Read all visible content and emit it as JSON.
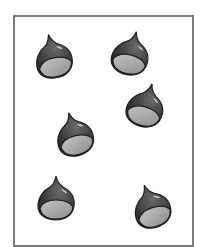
{
  "figure": {
    "count": 6,
    "colors": {
      "frame": "#7a7a7a",
      "shell_dark": "#2e2e2e",
      "shell_mid": "#555555",
      "base": "#a8a8a8",
      "highlight": "#d0d0d0"
    },
    "items": [
      {
        "id": "chestnut-1",
        "x": 33,
        "y": 33,
        "rotate": -12
      },
      {
        "id": "chestnut-2",
        "x": 111,
        "y": 30,
        "rotate": 14
      },
      {
        "id": "chestnut-3",
        "x": 126,
        "y": 82,
        "rotate": 16
      },
      {
        "id": "chestnut-4",
        "x": 54,
        "y": 111,
        "rotate": -14
      },
      {
        "id": "chestnut-5",
        "x": 36,
        "y": 175,
        "rotate": 0
      },
      {
        "id": "chestnut-6",
        "x": 131,
        "y": 183,
        "rotate": -18
      }
    ]
  }
}
